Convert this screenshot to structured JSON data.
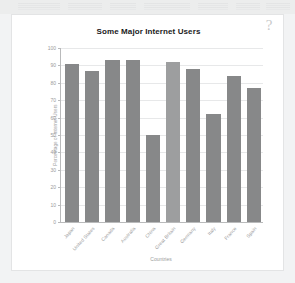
{
  "window": {
    "help_icon_label": "?"
  },
  "chart_data": {
    "type": "bar",
    "title": "Some Major Internet Users",
    "xlabel": "Countries",
    "ylabel": "Percentage of Internet Users",
    "categories": [
      "Japan",
      "United States",
      "Canada",
      "Australia",
      "China",
      "Great Britain",
      "Germany",
      "Italy",
      "France",
      "Spain"
    ],
    "values": [
      91,
      87,
      93,
      93,
      50,
      92,
      88,
      62,
      84,
      77
    ],
    "ylim": [
      0,
      100
    ],
    "yticks": [
      0,
      10,
      20,
      30,
      40,
      50,
      60,
      70,
      80,
      90,
      100
    ],
    "ytick_labels": [
      "0",
      "10",
      "20",
      "30",
      "40",
      "50",
      "60",
      "70",
      "80",
      "90",
      "100"
    ],
    "grid": true,
    "legend": "none",
    "bar_color": "#878889",
    "bar_color_highlight": "#9d9e9f",
    "highlight_index": 5
  }
}
